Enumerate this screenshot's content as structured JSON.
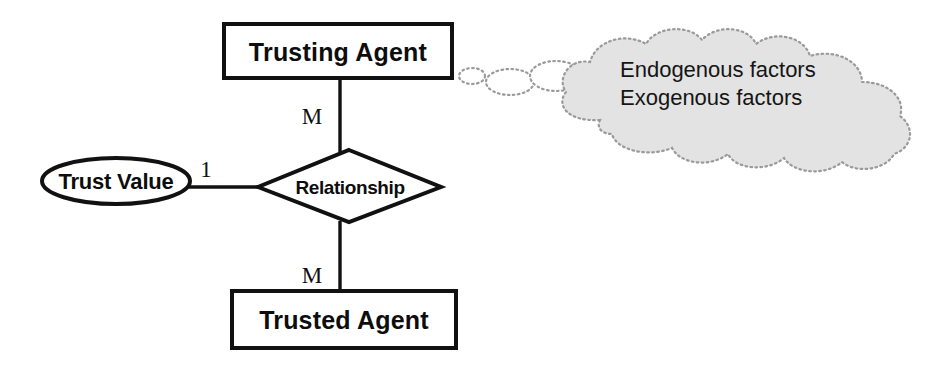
{
  "diagram": {
    "background_color": "#ffffff",
    "line_color": "#111111",
    "cloud_fill_color": "#e3e3e3",
    "cloud_outline_color": "#9a9a9a"
  },
  "entities": {
    "trusting_agent": {
      "label": "Trusting Agent",
      "shape": "rectangle"
    },
    "trusted_agent": {
      "label": "Trusted Agent",
      "shape": "rectangle"
    }
  },
  "attribute": {
    "trust_value": {
      "label": "Trust Value",
      "shape": "ellipse"
    }
  },
  "relationship": {
    "label": "Relationship",
    "shape": "diamond"
  },
  "cardinalities": {
    "trusting_to_relationship": "M",
    "relationship_to_trusted": "M",
    "trust_value_to_relationship": "1"
  },
  "cloud": {
    "lines": [
      "Endogenous factors",
      "Exogenous factors"
    ],
    "shape": "thought-cloud"
  }
}
